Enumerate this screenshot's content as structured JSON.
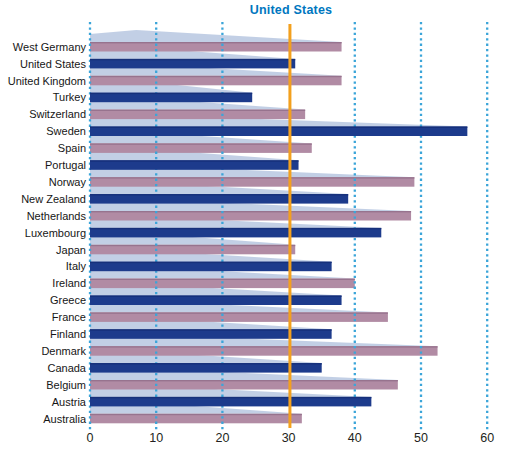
{
  "chart_data": {
    "type": "bar",
    "orientation": "horizontal",
    "categories": [
      "West Germany",
      "United States",
      "United Kingdom",
      "Turkey",
      "Switzerland",
      "Sweden",
      "Spain",
      "Portugal",
      "Norway",
      "New Zealand",
      "Netherlands",
      "Luxembourg",
      "Japan",
      "Italy",
      "Ireland",
      "Greece",
      "France",
      "Finland",
      "Denmark",
      "Canada",
      "Belgium",
      "Austria",
      "Australia"
    ],
    "values": [
      38,
      31,
      38,
      24.5,
      32.5,
      57,
      33.5,
      31.5,
      49,
      39,
      48.5,
      44,
      31,
      36.5,
      40,
      38,
      45,
      36.5,
      52.5,
      35,
      46.5,
      42.5,
      32
    ],
    "bar_color_pattern": [
      "purple",
      "blue"
    ],
    "reference_line": {
      "label": "United States",
      "value": 30.2
    },
    "x_ticks": [
      0,
      10,
      20,
      30,
      40,
      50,
      60
    ],
    "gridline_ticks": [
      0,
      10,
      20,
      40,
      50,
      60
    ],
    "xlim": [
      0,
      60
    ],
    "grid": "dotted-vertical",
    "colors": {
      "bar_blue": "#1d3b8c",
      "bar_blue_edge": "#16307a",
      "bar_purple": "#b18ba4",
      "bar_purple_edge": "#97738e",
      "wedge_triangle": "#6e8cc0",
      "gridline": "#3ba5d9",
      "reference_line": "#f3a01e",
      "reference_label_text": "#0077c0",
      "category_text": "#161616",
      "tick_text": "#231f20",
      "background": "#ffffff"
    }
  }
}
